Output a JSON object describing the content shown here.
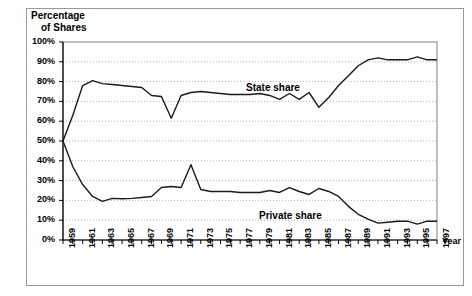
{
  "figure": {
    "y_axis_title_line1": "Percentage",
    "y_axis_title_line2": "of Shares",
    "x_axis_title": "Year"
  },
  "chart_data": {
    "type": "line",
    "title": "",
    "xlabel": "Year",
    "ylabel": "Percentage of Shares",
    "ylim": [
      0,
      100
    ],
    "xlim": [
      1959,
      1997
    ],
    "ytick_labels": [
      "0%",
      "10%",
      "20%",
      "30%",
      "40%",
      "50%",
      "60%",
      "70%",
      "80%",
      "90%",
      "100%"
    ],
    "ytick_values": [
      0,
      10,
      20,
      30,
      40,
      50,
      60,
      70,
      80,
      90,
      100
    ],
    "xtick_labels": [
      "1959",
      "1961",
      "1963",
      "1965",
      "1967",
      "1969",
      "1971",
      "1973",
      "1975",
      "1977",
      "1979",
      "1981",
      "1983",
      "1985",
      "1987",
      "1989",
      "1991",
      "1993",
      "1995",
      "1997"
    ],
    "grid": true,
    "grid_axis": "y",
    "legend_position": "inline-annotation",
    "line_color": "#1a1a1a",
    "x": [
      1959,
      1960,
      1961,
      1962,
      1963,
      1964,
      1965,
      1966,
      1967,
      1968,
      1969,
      1970,
      1971,
      1972,
      1973,
      1974,
      1975,
      1976,
      1977,
      1978,
      1979,
      1980,
      1981,
      1982,
      1983,
      1984,
      1985,
      1986,
      1987,
      1988,
      1989,
      1990,
      1991,
      1992,
      1993,
      1994,
      1995,
      1996,
      1997
    ],
    "series": [
      {
        "name": "State share",
        "label": "State share",
        "values": [
          50,
          63,
          78,
          80.5,
          79,
          78.5,
          78,
          77.5,
          77,
          73,
          72.5,
          61.5,
          73,
          74.5,
          75,
          74.5,
          74,
          73.5,
          73.5,
          73.5,
          74,
          73,
          71,
          74,
          71,
          74.5,
          67,
          72,
          78,
          83,
          88,
          91,
          92,
          91,
          91,
          91,
          92.5,
          91,
          91
        ]
      },
      {
        "name": "Private share",
        "label": "Private share",
        "values": [
          50,
          37,
          28,
          22,
          19.5,
          21,
          20.8,
          21,
          21.5,
          22,
          26.5,
          27,
          26.5,
          38,
          25.5,
          24.5,
          24.5,
          24.5,
          24,
          24,
          24,
          25,
          24,
          26.5,
          24.5,
          23,
          26,
          24.5,
          22,
          17,
          13,
          10.5,
          8.5,
          9,
          9.5,
          9.5,
          8,
          9.5,
          9.5
        ]
      }
    ],
    "annotations": [
      {
        "text": "State share",
        "x_pixel": 246,
        "y_pixel": 82
      },
      {
        "text": "Private share",
        "x_pixel": 259,
        "y_pixel": 210
      }
    ]
  }
}
